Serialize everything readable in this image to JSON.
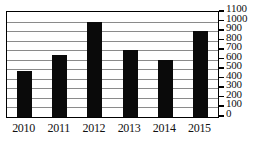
{
  "chart_data": {
    "type": "bar",
    "title": "",
    "subtitle": "",
    "xlabel": "",
    "ylabel": "",
    "categories": [
      "2010",
      "2011",
      "2012",
      "2013",
      "2014",
      "2015"
    ],
    "values": [
      480,
      650,
      1000,
      700,
      600,
      900
    ],
    "series": [
      {
        "name": "",
        "values": [
          480,
          650,
          1000,
          700,
          600,
          900
        ]
      }
    ],
    "ylim": [
      0,
      1100
    ],
    "ytick_step": 100,
    "yticks": [
      0,
      100,
      200,
      300,
      400,
      500,
      600,
      700,
      800,
      900,
      1000,
      1100
    ],
    "ytick_labels": [
      "0",
      "100",
      "200",
      "300",
      "400",
      "500",
      "600",
      "700",
      "800",
      "900",
      "1000",
      "1100"
    ],
    "ytick_position": "right",
    "grid": true,
    "grid_axis": "y",
    "legend": false,
    "legend_position": "none",
    "bar_color": "#0a0a0a",
    "grid_color": "#8a8a8a",
    "axis_color": "#000000",
    "plot_background": "#ffffff"
  }
}
